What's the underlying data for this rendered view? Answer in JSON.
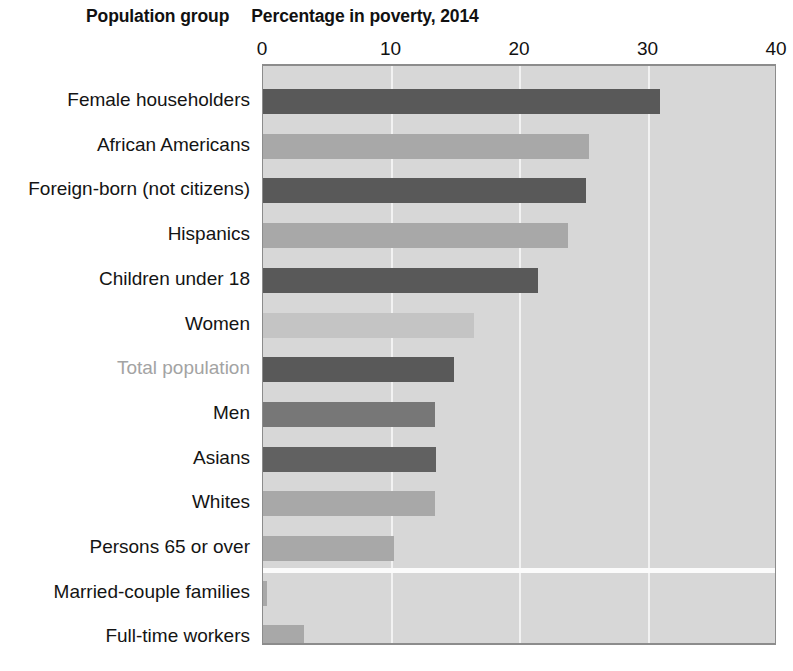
{
  "header": {
    "group_column_label": "Population group",
    "title": "Percentage in poverty, 2014"
  },
  "chart_data": {
    "type": "bar",
    "orientation": "horizontal",
    "title": "Percentage in poverty, 2014",
    "xlabel": "",
    "ylabel": "Population group",
    "xlim": [
      0,
      40
    ],
    "xticks": [
      0,
      10,
      20,
      30,
      40
    ],
    "xtick_labels": [
      "0",
      "10",
      "20",
      "30",
      "40"
    ],
    "grid": true,
    "grid_axis": "x",
    "legend": "none",
    "categories": [
      "Female householders",
      "African Americans",
      "Foreign-born (not citizens)",
      "Hispanics",
      "Children under 18",
      "Women",
      "Total population",
      "Men",
      "Asians",
      "Whites",
      "Persons 65 or over",
      "Married-couple families",
      "Full-time workers"
    ],
    "values": [
      30.9,
      25.4,
      25.1,
      23.7,
      21.4,
      16.4,
      14.9,
      13.4,
      13.5,
      13.4,
      10.2,
      0.3,
      3.2
    ],
    "bar_colors": [
      "#595959",
      "#a8a8a8",
      "#595959",
      "#a8a8a8",
      "#595959",
      "#c4c4c4",
      "#595959",
      "#777777",
      "#616161",
      "#a8a8a8",
      "#a8a8a8",
      "#a8a8a8",
      "#a8a8a8"
    ],
    "highlighted_category": "Total population",
    "plot_background": "#d7d7d7",
    "gridline_color": "#f2f2f2",
    "axis_border_color": "#8c8c8c"
  }
}
